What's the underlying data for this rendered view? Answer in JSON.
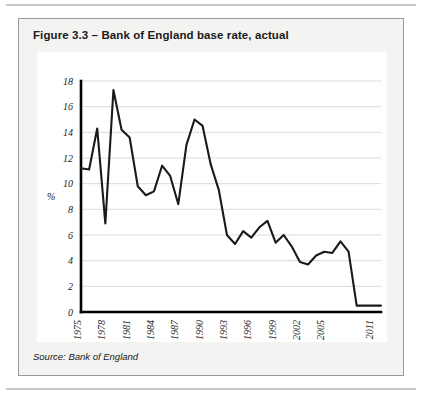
{
  "figure": {
    "title": "Figure 3.3 – Bank of England base rate, actual",
    "source": "Source: Bank of England",
    "border_color": "#9a9a9a",
    "panel_color": "#f3f3f1"
  },
  "chart_data": {
    "type": "line",
    "title": "Figure 3.3 – Bank of England base rate, actual",
    "xlabel": "Year",
    "ylabel": "%",
    "ylim": [
      0,
      18
    ],
    "xlim": [
      1975,
      2012
    ],
    "ytick_labels": [
      "0",
      "2",
      "4",
      "6",
      "8",
      "10",
      "12",
      "14",
      "16",
      "18"
    ],
    "ytick_values": [
      0,
      2,
      4,
      6,
      8,
      10,
      12,
      14,
      16,
      18
    ],
    "xtick_labels": [
      "1975",
      "1978",
      "1981",
      "1984",
      "1987",
      "1990",
      "1993",
      "1996",
      "1999",
      "2002",
      "2005",
      "2011"
    ],
    "xtick_values": [
      1975,
      1978,
      1981,
      1984,
      1987,
      1990,
      1993,
      1996,
      1999,
      2002,
      2005,
      2011
    ],
    "grid": "horizontal",
    "legend": "none",
    "line_color": "#1a1a1a",
    "series": [
      {
        "name": "Bank of England base rate",
        "x": [
          1975,
          1976,
          1977,
          1978,
          1979,
          1980,
          1981,
          1982,
          1983,
          1984,
          1985,
          1986,
          1987,
          1988,
          1989,
          1990,
          1991,
          1992,
          1993,
          1994,
          1995,
          1996,
          1997,
          1998,
          1999,
          2000,
          2001,
          2002,
          2003,
          2004,
          2005,
          2006,
          2007,
          2008,
          2009,
          2010,
          2011,
          2012
        ],
        "values": [
          11.2,
          11.1,
          14.3,
          6.9,
          17.3,
          14.2,
          13.6,
          9.8,
          9.1,
          9.4,
          11.4,
          10.6,
          8.4,
          13.0,
          15.0,
          14.5,
          11.5,
          9.5,
          6.0,
          5.3,
          6.3,
          5.8,
          6.6,
          7.1,
          5.4,
          6.0,
          5.1,
          3.9,
          3.7,
          4.4,
          4.7,
          4.6,
          5.5,
          4.7,
          0.5,
          0.5,
          0.5,
          0.5
        ]
      }
    ]
  }
}
